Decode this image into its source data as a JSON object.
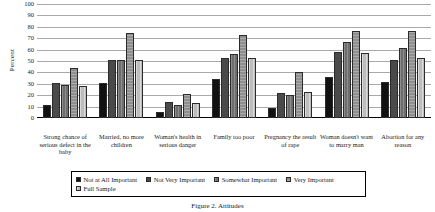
{
  "chart_data": {
    "type": "bar",
    "title": "",
    "xlabel": "",
    "ylabel": "Percent",
    "ylim": [
      0,
      100
    ],
    "ytick_step": 10,
    "yticks": [
      100,
      90,
      80,
      70,
      60,
      50,
      40,
      30,
      20,
      10,
      0
    ],
    "grid": true,
    "legend_position": "bottom",
    "categories": [
      "Strong chance of serious defect in the baby",
      "Married, no more children",
      "Woman's health in serious danger",
      "Family too poor",
      "Pregnancy the result of rape",
      "Woman doesn't want to marry man",
      "Abortion for any reason"
    ],
    "series": [
      {
        "name": "Not at All Important",
        "color": "#111111",
        "values": [
          11,
          31,
          5,
          34,
          9,
          36,
          32
        ]
      },
      {
        "name": "Not Very Important",
        "color": "#4a4a4a",
        "values": [
          31,
          51,
          14,
          53,
          22,
          58,
          51
        ]
      },
      {
        "name": "Somewhat Important",
        "color": "#6e6e6e",
        "values": [
          29,
          51,
          11,
          56,
          20,
          67,
          61
        ]
      },
      {
        "name": "Very Important",
        "color": "#8f8f8f",
        "values": [
          44,
          75,
          21,
          73,
          40,
          76,
          76
        ]
      },
      {
        "name": "Full Sample",
        "color": "#bdbdbd",
        "values": [
          28,
          51,
          13,
          53,
          23,
          57,
          53
        ]
      }
    ]
  },
  "axis": {
    "ylabel": "Percent"
  },
  "caption": "Figure 2. Attitudes"
}
